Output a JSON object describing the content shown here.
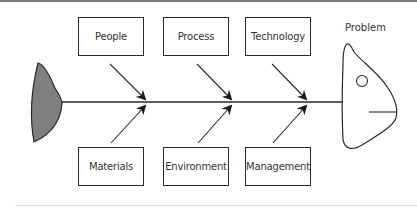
{
  "diagram": {
    "type": "fishbone",
    "problem_label": "Problem",
    "top_causes": [
      {
        "label": "People"
      },
      {
        "label": "Process"
      },
      {
        "label": "Technology"
      }
    ],
    "bottom_causes": [
      {
        "label": "Materials"
      },
      {
        "label": "Environment"
      },
      {
        "label": "Management"
      }
    ],
    "colors": {
      "line": "#2a2a2a",
      "tail_fill": "#7f7f7f",
      "background": "#ffffff"
    }
  }
}
